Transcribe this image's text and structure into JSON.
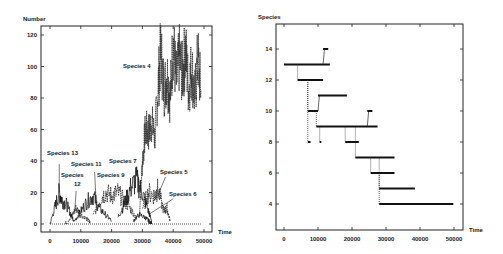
{
  "chart_data": [
    {
      "type": "line",
      "ylabel": "Number",
      "xlabel": "Time",
      "xlim": [
        0,
        50000
      ],
      "ylim": [
        0,
        120
      ],
      "xticks": [
        0,
        10000,
        20000,
        30000,
        40000,
        50000
      ],
      "yticks": [
        0,
        20,
        40,
        60,
        80,
        100,
        120
      ],
      "xtick_labels": [
        "0",
        "10000",
        "20000",
        "30000",
        "40000",
        "50000"
      ],
      "ytick_labels": [
        "0",
        "20",
        "40",
        "60",
        "80",
        "100",
        "120"
      ],
      "grid": false,
      "annotations": [
        {
          "text": "Species 13",
          "x": 3000,
          "y": 44
        },
        {
          "text": "Species",
          "x": 7500,
          "y": 30
        },
        {
          "text": "12",
          "x": 8500,
          "y": 24
        },
        {
          "text": "Species 11",
          "x": 14000,
          "y": 37
        },
        {
          "text": "Species 9",
          "x": 18500,
          "y": 30
        },
        {
          "text": "Species 7",
          "x": 27000,
          "y": 39
        },
        {
          "text": "Species 5",
          "x": 38000,
          "y": 32
        },
        {
          "text": "Species 6",
          "x": 41000,
          "y": 18
        },
        {
          "text": "Species 4",
          "x": 27000,
          "y": 100
        }
      ],
      "series": [
        {
          "name": "Species 4",
          "x": [
            29000,
            30000,
            31000,
            32000,
            33000,
            34000,
            35000,
            36000,
            37000,
            38000,
            39000,
            40000,
            41000,
            42000,
            43000,
            44000,
            45000,
            46000,
            47000,
            48000,
            49000
          ],
          "y": [
            5,
            40,
            60,
            58,
            65,
            55,
            85,
            110,
            85,
            95,
            80,
            115,
            90,
            105,
            95,
            110,
            85,
            100,
            80,
            105,
            85
          ]
        },
        {
          "name": "Species 13",
          "x": [
            0,
            1500,
            3000,
            4000,
            5500,
            7000,
            8000
          ],
          "y": [
            0,
            10,
            20,
            15,
            12,
            5,
            2
          ]
        },
        {
          "name": "Species 12",
          "x": [
            5000,
            7000,
            8500,
            10000,
            12000,
            13000
          ],
          "y": [
            0,
            5,
            10,
            6,
            3,
            1
          ]
        },
        {
          "name": "Species 11",
          "x": [
            8000,
            10000,
            12000,
            14000,
            16000,
            18000,
            20000
          ],
          "y": [
            2,
            8,
            14,
            18,
            10,
            6,
            2
          ]
        },
        {
          "name": "Species 9",
          "x": [
            14000,
            16000,
            18000,
            20000,
            22000,
            24000,
            26000,
            28000
          ],
          "y": [
            5,
            15,
            20,
            18,
            20,
            15,
            10,
            4
          ]
        },
        {
          "name": "Species 7",
          "x": [
            22000,
            24000,
            26000,
            28000,
            30000,
            32000,
            33000
          ],
          "y": [
            4,
            12,
            22,
            28,
            20,
            8,
            2
          ]
        },
        {
          "name": "Species 5",
          "x": [
            30000,
            32000,
            34000,
            35000,
            37000,
            38000,
            39000
          ],
          "y": [
            10,
            20,
            18,
            22,
            8,
            10,
            2
          ]
        },
        {
          "name": "Species 6",
          "x": [
            27000,
            29000,
            31000,
            32000,
            33000
          ],
          "y": [
            2,
            6,
            4,
            2,
            0
          ]
        }
      ]
    },
    {
      "type": "line",
      "ylabel": "Species",
      "xlabel": "Time",
      "xlim": [
        0,
        50000
      ],
      "ylim": [
        2.5,
        15.5
      ],
      "xticks": [
        0,
        10000,
        20000,
        30000,
        40000,
        50000
      ],
      "yticks": [
        4,
        6,
        8,
        10,
        12,
        14
      ],
      "xtick_labels": [
        "0",
        "10000",
        "20000",
        "30000",
        "40000",
        "50000"
      ],
      "ytick_labels": [
        "4",
        "6",
        "8",
        "10",
        "12",
        "14"
      ],
      "grid": false,
      "segments": [
        {
          "x0": 0,
          "x1": 13500,
          "y": 13
        },
        {
          "x0": 11500,
          "x1": 13000,
          "y": 14,
          "rise_from": 13
        },
        {
          "x0": 4000,
          "x1": 11500,
          "y": 12,
          "drop_from": 13
        },
        {
          "x0": 7000,
          "x1": 10000,
          "y": 10,
          "drop_from": 12
        },
        {
          "x0": 7000,
          "x1": 7800,
          "y": 8,
          "drop_from": 12
        },
        {
          "x0": 10000,
          "x1": 18500,
          "y": 11,
          "rise_from": 10
        },
        {
          "x0": 9500,
          "x1": 27500,
          "y": 9,
          "drop_from": 10
        },
        {
          "x0": 10500,
          "x1": 11000,
          "y": 8,
          "drop_from": 9
        },
        {
          "x0": 24500,
          "x1": 26000,
          "y": 10,
          "rise_from": 9
        },
        {
          "x0": 18000,
          "x1": 22000,
          "y": 8,
          "drop_from": 9
        },
        {
          "x0": 21000,
          "x1": 32500,
          "y": 7,
          "drop_from": 9
        },
        {
          "x0": 25500,
          "x1": 32500,
          "y": 6,
          "drop_from": 7
        },
        {
          "x0": 28000,
          "x1": 38500,
          "y": 5,
          "drop_from": 7
        },
        {
          "x0": 28000,
          "x1": 49800,
          "y": 4,
          "drop_from": 6
        }
      ]
    }
  ]
}
